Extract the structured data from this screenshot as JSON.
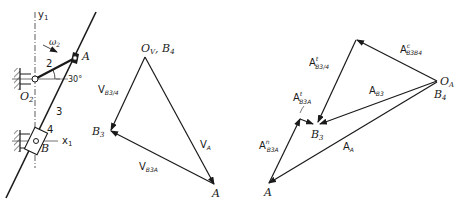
{
  "figure": {
    "mechanism": {
      "axis_y_label": "y",
      "axis_y_sub": "1",
      "axis_x_label": "x",
      "axis_x_sub": "1",
      "omega_label": "ω",
      "omega_sub": "2",
      "angle_label": "30°",
      "link_2_label": "2",
      "link_3_label": "3",
      "link_4_label": "4",
      "point_A": "A",
      "point_B": "B",
      "point_O2": "O",
      "point_O2_sub": "2"
    },
    "velocity_polygon": {
      "origin_label": "O",
      "origin_sub": "V",
      "origin_extra": ", B",
      "origin_extra_sub": "4",
      "point_B3": "B",
      "point_B3_sub": "3",
      "point_A": "A",
      "vec_VB3_4": "V",
      "vec_VB3_4_sub": "B3/4",
      "vec_VA": "V",
      "vec_VA_sub": "A",
      "vec_VB3A": "V",
      "vec_VB3A_sub": "B3A"
    },
    "acceleration_polygon": {
      "origin_label": "O",
      "origin_sub": "A",
      "origin_b4": "B",
      "origin_b4_sub": "4",
      "point_B3": "B",
      "point_B3_sub": "3",
      "point_A": "A",
      "vec_coriolis": "A",
      "vec_coriolis_sup": "c",
      "vec_coriolis_sub": "B3B4",
      "vec_t_B3_4": "A",
      "vec_t_B3_4_sup": "t",
      "vec_t_B3_4_sub": "B3/4",
      "vec_AB3": "A",
      "vec_AB3_sub": "B3",
      "vec_t_B3A": "A",
      "vec_t_B3A_sup": "t",
      "vec_t_B3A_sub": "B3A",
      "vec_n_B3A": "A",
      "vec_n_B3A_sup": "n",
      "vec_n_B3A_sub": "B3A",
      "vec_AA": "A",
      "vec_AA_sub": "A"
    }
  }
}
